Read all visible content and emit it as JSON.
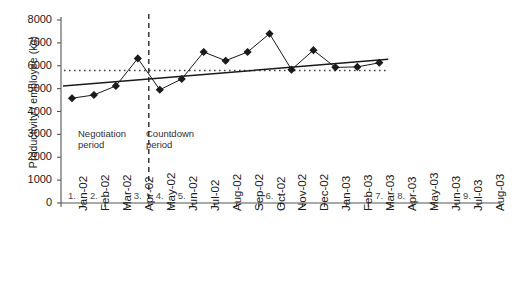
{
  "chart_data": {
    "type": "line",
    "title": "",
    "xlabel": "",
    "ylabel": "Productivity / employee (kg)",
    "ylim": [
      0,
      8000
    ],
    "ytick_values": [
      0,
      1000,
      2000,
      3000,
      4000,
      5000,
      6000,
      7000,
      8000
    ],
    "ytick_labels": [
      "0",
      "1000",
      "2000",
      "3000",
      "4000",
      "5000",
      "6000",
      "7000",
      "8000"
    ],
    "grid": false,
    "legend": "none",
    "categories": [
      "Jan-02",
      "Feb-02",
      "Mar-02",
      "Apr-02",
      "May-02",
      "Jun-02",
      "Jul-02",
      "Aug-02",
      "Sep-02",
      "Oct-02",
      "Nov-02",
      "Dec-02",
      "Jan-03",
      "Feb-03",
      "Mar-03",
      "Apr-03",
      "May-03",
      "Jun-03",
      "Jul-03",
      "Aug-03"
    ],
    "series": [
      {
        "name": "Productivity per employee",
        "marker": "diamond",
        "style": "solid-line-with-markers",
        "color": "#1a1a1a",
        "values": [
          4580,
          4720,
          5120,
          6320,
          4950,
          5420,
          6600,
          6220,
          6600,
          7400,
          5830,
          6680,
          5930,
          5950,
          6130,
          null,
          null,
          null,
          null,
          null
        ]
      },
      {
        "name": "Baseline reference",
        "style": "dotted-horizontal",
        "color": "#404040",
        "constant": 5790,
        "x_start": "Jan-02",
        "x_end": "Mar-03"
      },
      {
        "name": "Linear trend",
        "style": "solid-trend",
        "color": "#1a1a1a",
        "y_start": 5120,
        "y_end": 6280,
        "x_start": "Jan-02",
        "x_end": "Mar-03"
      }
    ],
    "vertical_divider": {
      "label": "period-boundary",
      "at": "Apr-02",
      "style": "dashed",
      "color": "#1a1a1a"
    },
    "annotations": [
      {
        "id": "negotiation",
        "text_line1": "Negotiation",
        "text_line2": "period"
      },
      {
        "id": "countdown",
        "text_line1": "Countdown",
        "text_line2": "period"
      }
    ],
    "event_markers": [
      {
        "label": "1.",
        "at": "Jan-02"
      },
      {
        "label": "2.",
        "at": "Feb-02"
      },
      {
        "label": "3.",
        "at": "Apr-02"
      },
      {
        "label": "4.",
        "at": "May-02"
      },
      {
        "label": "5.",
        "at": "Jun-02"
      },
      {
        "label": "6.",
        "at": "Oct-02"
      },
      {
        "label": "7.",
        "at": "Mar-03"
      },
      {
        "label": "8.",
        "at": "Apr-03"
      },
      {
        "label": "9.",
        "at": "Jul-03"
      }
    ]
  }
}
